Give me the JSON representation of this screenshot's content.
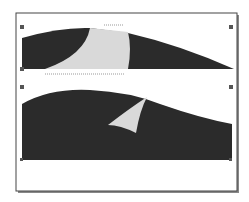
{
  "diagram": {
    "frame": {
      "x": 16,
      "y": 13,
      "w": 221,
      "h": 178,
      "stroke": "#444444"
    },
    "colors": {
      "dark": "#2b2b2b",
      "light": "#d9d9d9",
      "handle": "#555555",
      "selection": "#999999"
    },
    "top_shape": {
      "description": "dark filled curve with light cutout region, selected with handles",
      "handles": [
        "top-left",
        "top-right",
        "bottom-left",
        "bottom-right"
      ]
    },
    "bottom_shape": {
      "description": "dark filled hill shape with light curved sliver",
      "handles": [
        "top-left",
        "top-right",
        "bottom-left",
        "bottom-right"
      ]
    }
  }
}
